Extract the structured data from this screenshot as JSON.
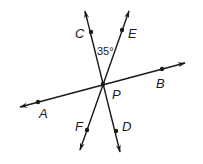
{
  "diagram": {
    "type": "intersecting-lines",
    "intersection_point": {
      "label": "P",
      "x": 103,
      "y": 84
    },
    "lines": [
      {
        "name": "line-AB",
        "points": [
          "A",
          "P",
          "B"
        ]
      },
      {
        "name": "line-CD",
        "points": [
          "C",
          "P",
          "D"
        ]
      },
      {
        "name": "line-EF",
        "points": [
          "E",
          "P",
          "F"
        ]
      }
    ],
    "points": [
      {
        "label": "A",
        "x": 38,
        "y": 102
      },
      {
        "label": "B",
        "x": 162,
        "y": 69
      },
      {
        "label": "C",
        "x": 91,
        "y": 32
      },
      {
        "label": "D",
        "x": 116,
        "y": 131
      },
      {
        "label": "E",
        "x": 122,
        "y": 30
      },
      {
        "label": "F",
        "x": 87,
        "y": 130
      },
      {
        "label": "P",
        "x": 103,
        "y": 84
      }
    ],
    "angle_label": "35°",
    "angle_between": [
      "C",
      "P",
      "E"
    ]
  },
  "labels": {
    "A": "A",
    "B": "B",
    "C": "C",
    "D": "D",
    "E": "E",
    "F": "F",
    "P": "P",
    "angle": "35°"
  },
  "colors": {
    "stroke": "#1a1a1a",
    "background": "#ffffff"
  }
}
